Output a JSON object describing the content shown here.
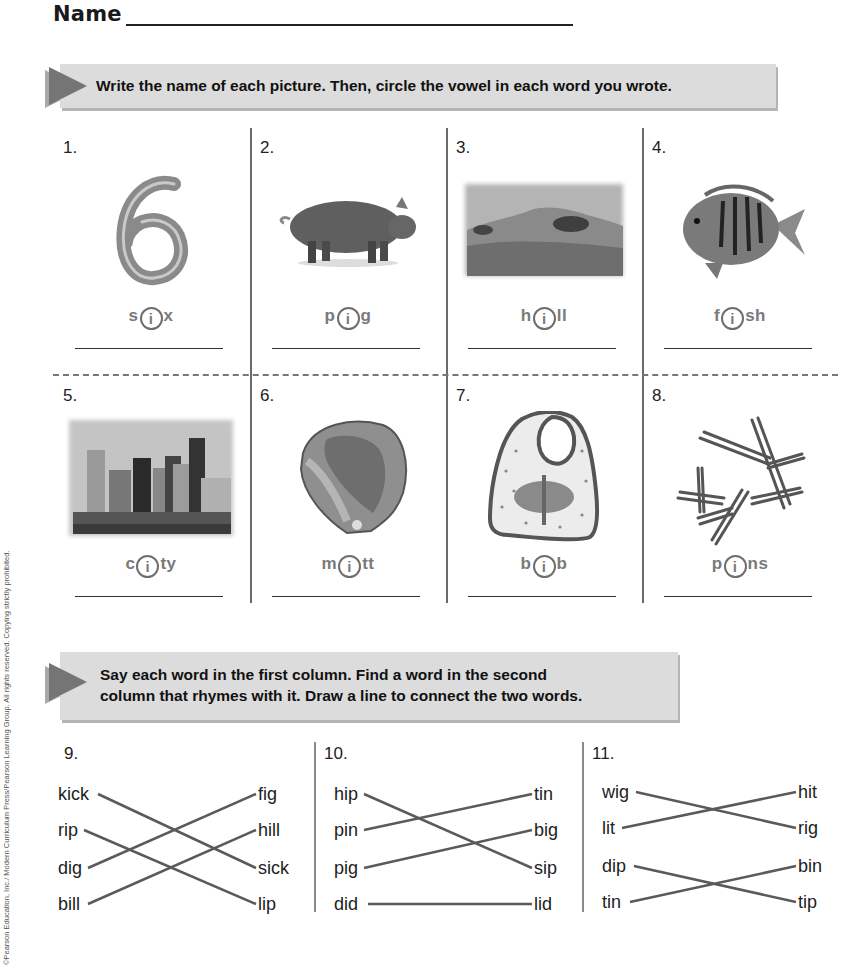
{
  "header": {
    "name_label": "Name"
  },
  "section1": {
    "instruction": "Write the name of each picture. Then, circle the vowel in each word you wrote.",
    "items": [
      {
        "number": "1.",
        "picture": "number-six",
        "pre": "s",
        "vowel": "i",
        "post": "x"
      },
      {
        "number": "2.",
        "picture": "pig",
        "pre": "p",
        "vowel": "i",
        "post": "g"
      },
      {
        "number": "3.",
        "picture": "hill",
        "pre": "h",
        "vowel": "i",
        "post": "ll"
      },
      {
        "number": "4.",
        "picture": "fish",
        "pre": "f",
        "vowel": "i",
        "post": "sh"
      },
      {
        "number": "5.",
        "picture": "city",
        "pre": "c",
        "vowel": "i",
        "post": "ty"
      },
      {
        "number": "6.",
        "picture": "mitt",
        "pre": "m",
        "vowel": "i",
        "post": "tt"
      },
      {
        "number": "7.",
        "picture": "bib",
        "pre": "b",
        "vowel": "i",
        "post": "b"
      },
      {
        "number": "8.",
        "picture": "pins",
        "pre": "p",
        "vowel": "i",
        "post": "ns"
      }
    ]
  },
  "section2": {
    "instruction_line1": "Say each word in the first column. Find a word in the second",
    "instruction_line2": "column that rhymes with it. Draw a line to connect the two words.",
    "groups": [
      {
        "number": "9.",
        "left": [
          "kick",
          "rip",
          "dig",
          "bill"
        ],
        "right": [
          "fig",
          "hill",
          "sick",
          "lip"
        ],
        "connections": [
          [
            0,
            2
          ],
          [
            1,
            3
          ],
          [
            2,
            0
          ],
          [
            3,
            1
          ]
        ]
      },
      {
        "number": "10.",
        "left": [
          "hip",
          "pin",
          "pig",
          "did"
        ],
        "right": [
          "tin",
          "big",
          "sip",
          "lid"
        ],
        "connections": [
          [
            0,
            2
          ],
          [
            1,
            0
          ],
          [
            2,
            1
          ],
          [
            3,
            3
          ]
        ]
      },
      {
        "number": "11.",
        "left": [
          "wig",
          "lit",
          "dip",
          "tin"
        ],
        "right": [
          "hit",
          "rig",
          "bin",
          "tip"
        ],
        "connections": [
          [
            0,
            1
          ],
          [
            1,
            0
          ],
          [
            2,
            3
          ],
          [
            3,
            2
          ]
        ]
      }
    ]
  },
  "footer": {
    "copyright": "©Pearson Education, Inc./ Modern Curriculum Press/Pearson Learning Group. All rights reserved. Copying strictly prohibited."
  },
  "colors": {
    "banner_bg": "#dcdcdc",
    "arrow": "#757575",
    "word_gray": "#7a7a7a",
    "line": "#5a5a5a"
  }
}
